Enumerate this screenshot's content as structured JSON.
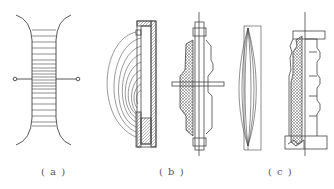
{
  "figure": {
    "panels": [
      {
        "id": "a",
        "caption": "( a )",
        "description": "Field-grading electrode pair with terminals and parallel field lines"
      },
      {
        "id": "b",
        "caption": "( b )",
        "description": "Electrode with field lines and wall-through bushing with flange"
      },
      {
        "id": "c",
        "caption": "( c )",
        "description": "Capacitor-graded foil layers and post insulator cross-section"
      }
    ],
    "colors": {
      "line": "#444444",
      "background": "#ffffff",
      "hatch": "#666666"
    }
  }
}
